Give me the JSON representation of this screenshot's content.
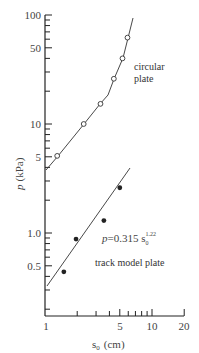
{
  "chart_data": {
    "type": "scatter",
    "xscale": "log",
    "yscale": "log",
    "xlabel": "s0 (cm)",
    "ylabel": "p (kPa)",
    "xlim": [
      1,
      20
    ],
    "ylim": [
      0.17,
      100
    ],
    "x_ticks": [
      "1",
      "5",
      "10",
      "20"
    ],
    "y_ticks": [
      "0.5",
      "1.0",
      "5",
      "10",
      "50",
      "100"
    ],
    "grid": false,
    "series": [
      {
        "name": "circular plate",
        "marker": "open-circle",
        "x": [
          1.3,
          2.3,
          3.3,
          4.4,
          5.3,
          5.9
        ],
        "y": [
          5.1,
          10,
          15.3,
          26,
          40,
          62
        ]
      },
      {
        "name": "track model plate",
        "marker": "filled-circle",
        "x": [
          1.5,
          1.95,
          3.55,
          5.0
        ],
        "y": [
          0.44,
          0.88,
          1.3,
          2.6
        ],
        "fit": "p = 0.315 s0^1.22"
      }
    ],
    "annotations": [
      "circular plate",
      "track model plate",
      "p=0.315 s0^1.22"
    ]
  },
  "labels": {
    "xlabel_main": "s",
    "xlabel_sub": "0",
    "xlabel_unit": "(cm)",
    "ylabel_main": "p",
    "ylabel_unit": "(kPa)",
    "circ_line1": "circular",
    "circ_line2": "plate",
    "track": "track model plate",
    "eq_p": "p",
    "eq_body": "=0.315 s",
    "eq_sub": "0",
    "eq_sup": "1.22",
    "yt100": "100",
    "yt50": "50",
    "yt10": "10",
    "yt5": "5",
    "yt1": "1.0",
    "yt05": "0.5",
    "xt1": "1",
    "xt5": "5",
    "xt10": "10",
    "xt20": "20"
  }
}
